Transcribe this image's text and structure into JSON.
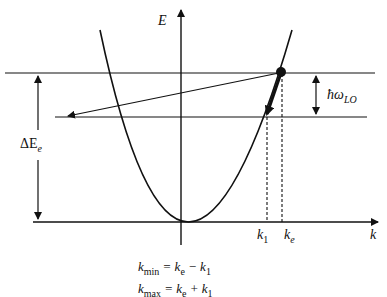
{
  "diagram": {
    "type": "energy-dispersion",
    "axes": {
      "vertical_label": "E",
      "horizontal_label": "k"
    },
    "labels": {
      "delta_e_prefix": "ΔE",
      "delta_e_sub": "e",
      "phonon_prefix": "ħω",
      "phonon_sub": "LO",
      "k1_main": "k",
      "k1_sub": "1",
      "ke_main": "k",
      "ke_sub": "e"
    },
    "formulas": {
      "kmin_lhs": "k",
      "kmin_sub": "min",
      "kmin_rhs_a": " = k",
      "kmin_rhs_a_sub": "e",
      "kmin_rhs_b": " − k",
      "kmin_rhs_b_sub": "1",
      "kmax_lhs": "k",
      "kmax_sub": "max",
      "kmax_rhs_a": " = k",
      "kmax_rhs_a_sub": "e",
      "kmax_rhs_b": " + k",
      "kmax_rhs_b_sub": "1"
    },
    "colors": {
      "stroke": "#111111",
      "background": "#ffffff"
    }
  }
}
